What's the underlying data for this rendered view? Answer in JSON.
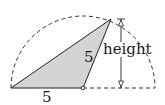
{
  "diagram": {
    "type": "geometry",
    "labels": {
      "base_length": "5",
      "side_length": "5",
      "height": "height"
    },
    "colors": {
      "triangle_fill": "#d4d4d4",
      "stroke": "#222222",
      "dashed_arc": "#333333"
    },
    "geometry": {
      "semicircle_center": [
        83,
        88
      ],
      "semicircle_radius": 72,
      "triangle_vertices": [
        [
          11,
          88
        ],
        [
          83,
          88
        ],
        [
          111,
          19
        ]
      ],
      "height_marker_x": 121
    }
  }
}
